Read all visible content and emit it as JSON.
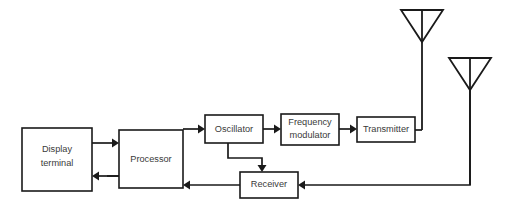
{
  "diagram": {
    "background_color": "#ffffff",
    "line_color": "#1a1a1a",
    "text_color": "#3a3a3a",
    "blocks": [
      {
        "id": "display-terminal",
        "label_line1": "Display",
        "label_line2": "terminal",
        "x": 22,
        "y": 128,
        "width": 70,
        "height": 63
      },
      {
        "id": "processor",
        "label_line1": "Processor",
        "label_line2": "",
        "x": 119,
        "y": 130,
        "width": 64,
        "height": 58
      },
      {
        "id": "oscillator",
        "label_line1": "Oscillator",
        "label_line2": "",
        "x": 205,
        "y": 115,
        "width": 58,
        "height": 28
      },
      {
        "id": "frequency-modulator",
        "label_line1": "Frequency",
        "label_line2": "modulator",
        "x": 281,
        "y": 114,
        "width": 58,
        "height": 31
      },
      {
        "id": "transmitter",
        "label_line1": "Transmitter",
        "label_line2": "",
        "x": 357,
        "y": 117,
        "width": 58,
        "height": 25
      },
      {
        "id": "receiver",
        "label_line1": "Receiver",
        "label_line2": "",
        "x": 240,
        "y": 172,
        "width": 58,
        "height": 26
      }
    ],
    "antennas": [
      {
        "id": "transmit-antenna",
        "apex_x": 422,
        "top_y": 10,
        "half_width": 21,
        "triangle_height": 32,
        "stem_bottom_y": 130
      },
      {
        "id": "receive-antenna",
        "apex_x": 470,
        "top_y": 58,
        "half_width": 21,
        "triangle_height": 32,
        "stem_bottom_y": 185
      }
    ],
    "connections": [
      {
        "id": "display-to-processor",
        "label": "Display terminal to Processor"
      },
      {
        "id": "processor-to-display",
        "label": "Processor to Display terminal"
      },
      {
        "id": "processor-to-oscillator",
        "label": "Processor to Oscillator"
      },
      {
        "id": "oscillator-to-modulator",
        "label": "Oscillator to Frequency modulator"
      },
      {
        "id": "modulator-to-transmitter",
        "label": "Frequency modulator to Transmitter"
      },
      {
        "id": "transmitter-to-antenna",
        "label": "Transmitter to transmit antenna"
      },
      {
        "id": "oscillator-to-receiver",
        "label": "Oscillator to Receiver"
      },
      {
        "id": "antenna-to-receiver",
        "label": "Receive antenna to Receiver"
      },
      {
        "id": "receiver-to-processor",
        "label": "Receiver to Processor"
      },
      {
        "id": "receiver-to-display",
        "label": "Receiver line to Display terminal"
      }
    ]
  }
}
